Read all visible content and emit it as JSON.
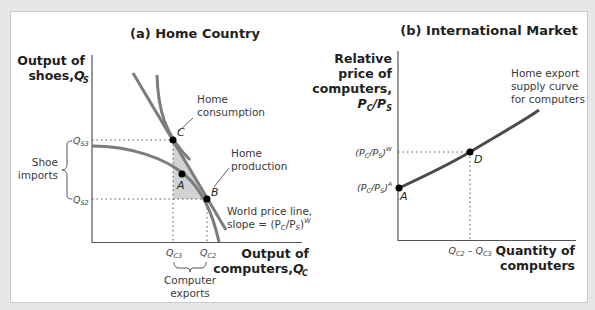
{
  "panel_a": {
    "title": "(a) Home Country",
    "y_axis_label_line1": "Output of",
    "y_axis_label_line2": "shoes, ",
    "y_axis_symbol": "Q",
    "y_axis_symbol_sub": "S",
    "x_axis_label_line1": "Output of",
    "x_axis_label_line2": "computers, ",
    "x_axis_symbol": "Q",
    "x_axis_symbol_sub": "C",
    "tick_qs3": "Q",
    "tick_qs3_sub": "S3",
    "tick_qs2": "Q",
    "tick_qs2_sub": "S2",
    "tick_qc3": "Q",
    "tick_qc3_sub": "C3",
    "tick_qc2": "Q",
    "tick_qc2_sub": "C2",
    "shoe_imports_line1": "Shoe",
    "shoe_imports_line2": "imports",
    "computer_exports_line1": "Computer",
    "computer_exports_line2": "exports",
    "home_consumption_line1": "Home",
    "home_consumption_line2": "consumption",
    "home_production_line1": "Home",
    "home_production_line2": "production",
    "world_price_line1": "World price line,",
    "world_price_line2": "slope = (P",
    "world_price_sub_c": "C",
    "world_price_mid": "/P",
    "world_price_sub_s": "S",
    "world_price_close": ")",
    "world_price_sup": "W",
    "point_c": "C",
    "point_a": "A",
    "point_b": "B"
  },
  "panel_b": {
    "title": "(b) International Market",
    "y_axis_label_line1": "Relative",
    "y_axis_label_line2": "price of",
    "y_axis_label_line3": "computers,",
    "y_axis_label_line4_p": "P",
    "y_axis_label_line4_c": "C",
    "y_axis_label_line4_mid": "/P",
    "y_axis_label_line4_s": "S",
    "x_axis_label_line1": "Quantity of",
    "x_axis_label_line2": "computers",
    "tick_world_price": "(P",
    "tick_world_price_sub_c": "C",
    "tick_world_price_mid": "/P",
    "tick_world_price_sub_s": "S",
    "tick_world_price_close": ")",
    "tick_world_price_sup": "W",
    "tick_autarky_price": "(P",
    "tick_autarky_price_sub_c": "C",
    "tick_autarky_price_mid": "/P",
    "tick_autarky_price_sub_s": "S",
    "tick_autarky_price_close": ")",
    "tick_autarky_price_sup": "A",
    "tick_qty_q1": "Q",
    "tick_qty_q1_sub": "C2",
    "tick_qty_minus": " – ",
    "tick_qty_q2": "Q",
    "tick_qty_q2_sub": "C3",
    "curve_label_line1": "Home export",
    "curve_label_line2": "supply curve",
    "curve_label_line3": "for computers",
    "point_a": "A",
    "point_d": "D"
  },
  "colors": {
    "curve_gray": "#7b7c7e",
    "supply_curve": "#4a4a4c",
    "shade": "#d1d2d4",
    "point": "#000000",
    "background_outer": "#e6e7e8",
    "panel": "#ffffff"
  }
}
